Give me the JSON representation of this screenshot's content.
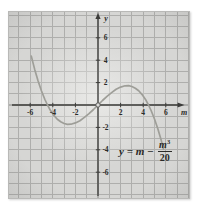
{
  "figure": {
    "x_axis_label": "m",
    "y_axis_label": "y",
    "equation": {
      "lhs": "y = m −",
      "numerator_base": "m",
      "numerator_exponent": "3",
      "denominator": "20"
    }
  },
  "chart_data": {
    "type": "line",
    "title": "",
    "equation_label": "y = m − m³/20",
    "xlabel": "m",
    "ylabel": "y",
    "grid": true,
    "grid_unit": 1,
    "xlim": [
      -7.9,
      8.1
    ],
    "ylim": [
      -8.3,
      8.3
    ],
    "x_ticks": [
      -6,
      -4,
      -2,
      2,
      4,
      6
    ],
    "y_ticks": [
      6,
      4,
      2,
      -2,
      -4,
      -6
    ],
    "origin_marker": [
      0,
      0
    ],
    "points": [
      [
        -5.9,
        4.37
      ],
      [
        -5.6,
        3.18
      ],
      [
        -5.3,
        2.14
      ],
      [
        -5.0,
        1.25
      ],
      [
        -4.7,
        0.49
      ],
      [
        -4.47,
        0.0
      ],
      [
        -4.2,
        -0.5
      ],
      [
        -3.9,
        -0.93
      ],
      [
        -3.6,
        -1.27
      ],
      [
        -3.3,
        -1.5
      ],
      [
        -3.0,
        -1.65
      ],
      [
        -2.7,
        -1.72
      ],
      [
        -2.4,
        -1.71
      ],
      [
        -2.0,
        -1.6
      ],
      [
        -1.6,
        -1.4
      ],
      [
        -1.2,
        -1.11
      ],
      [
        -0.8,
        -0.77
      ],
      [
        -0.4,
        -0.4
      ],
      [
        0,
        0
      ],
      [
        0.4,
        0.4
      ],
      [
        0.8,
        0.77
      ],
      [
        1.2,
        1.11
      ],
      [
        1.6,
        1.4
      ],
      [
        2.0,
        1.6
      ],
      [
        2.4,
        1.71
      ],
      [
        2.7,
        1.72
      ],
      [
        3.0,
        1.65
      ],
      [
        3.3,
        1.5
      ],
      [
        3.6,
        1.27
      ],
      [
        3.9,
        0.93
      ],
      [
        4.2,
        0.5
      ],
      [
        4.47,
        0.0
      ],
      [
        4.7,
        -0.49
      ],
      [
        5.0,
        -1.25
      ],
      [
        5.3,
        -2.14
      ],
      [
        5.6,
        -3.18
      ],
      [
        5.8,
        -3.95
      ]
    ]
  },
  "colors": {
    "paper": "#d6d6d4",
    "grid_line": "#aeaeac",
    "axis": "#3c3c3a",
    "curve": "#9e9e98",
    "text": "#2b2b29",
    "page_background": "#ffffff"
  }
}
